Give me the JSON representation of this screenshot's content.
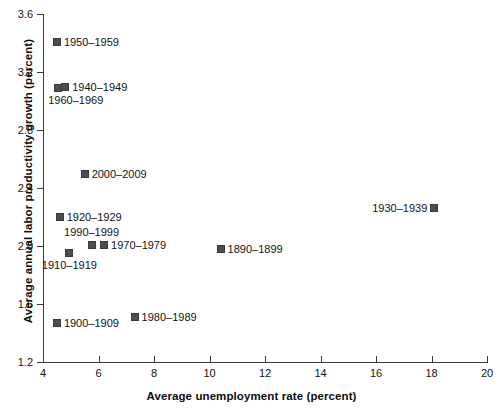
{
  "chart_data": {
    "type": "scatter",
    "title": "",
    "xlabel": "Average unemployment rate (percent)",
    "ylabel": "Average annual labor productivity growth (percent)",
    "xlim": [
      4,
      20
    ],
    "ylim": [
      1.2,
      3.6
    ],
    "xticks": [
      4,
      6,
      8,
      10,
      12,
      14,
      16,
      18,
      20
    ],
    "xtick_labels": [
      "4",
      "6",
      "8",
      "10",
      "12",
      "14",
      "16",
      "18",
      "20"
    ],
    "yticks": [
      1.2,
      1.6,
      2.0,
      2.4,
      2.8,
      3.2,
      3.6
    ],
    "ytick_labels": [
      "1.2",
      "1.6",
      "2.0",
      "2.4",
      "2.8",
      "3.2",
      "3.6"
    ],
    "grid": false,
    "legend": "none (points annotated inline)",
    "marker_color": "#4d4d4d",
    "axis_color": "#3a3a3a",
    "text_color": "#121212",
    "points": [
      {
        "label": "1950–1959",
        "x": 4.5,
        "y": 3.41,
        "label_pos": "right"
      },
      {
        "label": "1940–1949",
        "x": 4.8,
        "y": 3.1,
        "label_pos": "right"
      },
      {
        "label": "1960–1969",
        "x": 4.55,
        "y": 3.09,
        "label_pos": "below-left"
      },
      {
        "label": "2000–2009",
        "x": 5.5,
        "y": 2.5,
        "label_pos": "right"
      },
      {
        "label": "1930–1939",
        "x": 18.1,
        "y": 2.26,
        "label_pos": "left"
      },
      {
        "label": "1920–1929",
        "x": 4.6,
        "y": 2.2,
        "label_pos": "right"
      },
      {
        "label": "1990–1999",
        "x": 5.75,
        "y": 2.01,
        "label_pos": "above"
      },
      {
        "label": "1970–1979",
        "x": 6.2,
        "y": 2.01,
        "label_pos": "right"
      },
      {
        "label": "1890–1899",
        "x": 10.4,
        "y": 1.98,
        "label_pos": "right"
      },
      {
        "label": "1910–1919",
        "x": 4.95,
        "y": 1.95,
        "label_pos": "below-center"
      },
      {
        "label": "1980–1989",
        "x": 7.3,
        "y": 1.51,
        "label_pos": "right"
      },
      {
        "label": "1900–1909",
        "x": 4.5,
        "y": 1.47,
        "label_pos": "right"
      }
    ]
  }
}
